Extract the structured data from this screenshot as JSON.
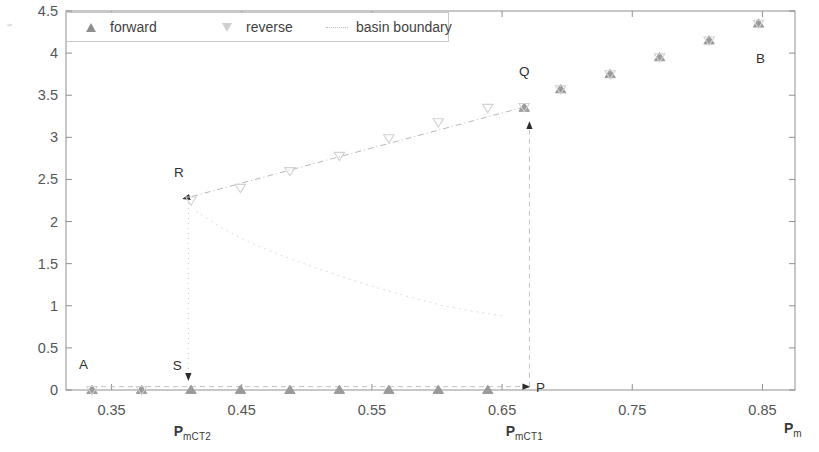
{
  "figure": {
    "background": "#ffffff",
    "axis_color": "#909090",
    "corner_artifact": "⌁"
  },
  "legend": {
    "position": "top-left",
    "border_color": "#c8c8c8",
    "entries": [
      {
        "label": "forward",
        "marker": "triangle-up-filled",
        "color": "#8f8f8f"
      },
      {
        "label": "reverse",
        "marker": "triangle-down-open",
        "color": "#cfcfcf"
      },
      {
        "label": "basin boundary",
        "marker": "dotted-line",
        "color": "#c0c0c0"
      }
    ]
  },
  "axes": {
    "x": {
      "label_main": "P",
      "label_sub": "m",
      "ticks": [
        0.35,
        0.45,
        0.55,
        0.65,
        0.75,
        0.85
      ],
      "tick_labels": [
        "0.35",
        "0.45",
        "0.55",
        "0.65",
        "0.75",
        "0.85"
      ],
      "min": 0.315,
      "max": 0.875,
      "annotations": [
        {
          "text_main": "P",
          "text_sub": "mCT2",
          "x": 0.41
        },
        {
          "text_main": "P",
          "text_sub": "mCT1",
          "x": 0.665
        }
      ]
    },
    "y": {
      "ticks": [
        0,
        0.5,
        1,
        1.5,
        2,
        2.5,
        3,
        3.5,
        4,
        4.5
      ],
      "tick_labels": [
        "0",
        "0.5",
        "1",
        "1.5",
        "2",
        "2.5",
        "3",
        "3.5",
        "4",
        "4.5"
      ],
      "min": 0,
      "max": 4.5
    }
  },
  "point_labels": [
    {
      "name": "A",
      "text": "A",
      "x": 0.325,
      "y": 0.3
    },
    {
      "name": "S",
      "text": "S",
      "x": 0.397,
      "y": 0.28
    },
    {
      "name": "P",
      "text": "P",
      "x": 0.676,
      "y": 0.02
    },
    {
      "name": "R",
      "text": "R",
      "x": 0.398,
      "y": 2.58
    },
    {
      "name": "Q",
      "text": "Q",
      "x": 0.663,
      "y": 3.77
    },
    {
      "name": "B",
      "text": "B",
      "x": 0.845,
      "y": 3.93
    }
  ],
  "chart_data": {
    "type": "scatter",
    "title": "",
    "xlabel": "P_m",
    "ylabel": "",
    "xlim": [
      0.315,
      0.875
    ],
    "ylim": [
      0,
      4.5
    ],
    "grid": false,
    "legend_position": "top-left",
    "series": [
      {
        "name": "forward",
        "marker": "triangle-up-filled",
        "color": "#9a9a9a",
        "points": [
          [
            0.335,
            0.0
          ],
          [
            0.373,
            0.0
          ],
          [
            0.411,
            0.0
          ],
          [
            0.449,
            0.0
          ],
          [
            0.487,
            0.0
          ],
          [
            0.525,
            0.0
          ],
          [
            0.563,
            0.0
          ],
          [
            0.601,
            0.0
          ],
          [
            0.639,
            0.0
          ],
          [
            0.667,
            3.35
          ],
          [
            0.695,
            3.57
          ],
          [
            0.733,
            3.75
          ],
          [
            0.771,
            3.95
          ],
          [
            0.809,
            4.15
          ],
          [
            0.847,
            4.35
          ]
        ]
      },
      {
        "name": "reverse",
        "marker": "triangle-down-open",
        "color": "#d2d2d2",
        "points": [
          [
            0.335,
            0.0
          ],
          [
            0.373,
            0.0
          ],
          [
            0.411,
            2.25
          ],
          [
            0.449,
            2.4
          ],
          [
            0.487,
            2.6
          ],
          [
            0.525,
            2.78
          ],
          [
            0.563,
            2.99
          ],
          [
            0.601,
            3.18
          ],
          [
            0.639,
            3.35
          ],
          [
            0.667,
            3.36
          ],
          [
            0.695,
            3.57
          ],
          [
            0.733,
            3.75
          ],
          [
            0.771,
            3.95
          ],
          [
            0.809,
            4.15
          ],
          [
            0.847,
            4.35
          ]
        ]
      },
      {
        "name": "basin boundary",
        "marker": "dotted-line",
        "color": "#dadada",
        "points": [
          [
            0.415,
            2.12
          ],
          [
            0.435,
            1.92
          ],
          [
            0.455,
            1.76
          ],
          [
            0.48,
            1.6
          ],
          [
            0.505,
            1.46
          ],
          [
            0.53,
            1.33
          ],
          [
            0.555,
            1.21
          ],
          [
            0.58,
            1.1
          ],
          [
            0.605,
            1.0
          ],
          [
            0.63,
            0.93
          ],
          [
            0.65,
            0.88
          ]
        ]
      }
    ],
    "hysteresis_paths": [
      {
        "name": "upper-branch-trace",
        "from": [
          0.667,
          3.36
        ],
        "to": [
          0.405,
          2.27
        ],
        "arrow_at": "to",
        "style": "dash-dot",
        "color": "#b9b9b9"
      },
      {
        "name": "drop-R-to-S",
        "from": [
          0.409,
          2.22
        ],
        "to": [
          0.409,
          0.12
        ],
        "arrow_at": "to",
        "style": "dotted",
        "color": "#c8c8c8"
      },
      {
        "name": "lower-branch-trace",
        "from": [
          0.335,
          0.04
        ],
        "to": [
          0.671,
          0.04
        ],
        "arrow_at": "to",
        "style": "dashed",
        "color": "#c2c2c2"
      },
      {
        "name": "jump-P-to-Q",
        "from": [
          0.671,
          0.04
        ],
        "to": [
          0.671,
          3.18
        ],
        "arrow_at": "to",
        "style": "dashed",
        "color": "#c2c2c2"
      }
    ]
  }
}
